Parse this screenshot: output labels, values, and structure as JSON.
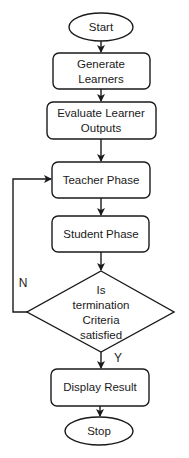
{
  "diagram": {
    "type": "flowchart",
    "colors": {
      "stroke": "#1a1a1a",
      "fill": "#ffffff",
      "text": "#1a1a1a"
    },
    "nodes": {
      "start": {
        "shape": "ellipse",
        "lines": [
          "Start"
        ]
      },
      "generate": {
        "shape": "rounded-rect",
        "lines": [
          "Generate",
          "Learners"
        ]
      },
      "evaluate": {
        "shape": "rounded-rect",
        "lines": [
          "Evaluate Learner",
          "Outputs"
        ]
      },
      "teacher": {
        "shape": "rounded-rect",
        "lines": [
          "Teacher Phase"
        ]
      },
      "student": {
        "shape": "rounded-rect",
        "lines": [
          "Student Phase"
        ]
      },
      "decision": {
        "shape": "diamond",
        "lines": [
          "Is",
          "termination",
          "Criteria",
          "satisfied"
        ]
      },
      "display": {
        "shape": "rounded-rect",
        "lines": [
          "Display Result"
        ]
      },
      "stop": {
        "shape": "ellipse",
        "lines": [
          "Stop"
        ]
      }
    },
    "edges": [
      {
        "from": "start",
        "to": "generate"
      },
      {
        "from": "generate",
        "to": "evaluate"
      },
      {
        "from": "evaluate",
        "to": "teacher"
      },
      {
        "from": "teacher",
        "to": "student"
      },
      {
        "from": "student",
        "to": "decision"
      },
      {
        "from": "decision",
        "to": "teacher",
        "label": "N"
      },
      {
        "from": "decision",
        "to": "display",
        "label": "Y"
      },
      {
        "from": "display",
        "to": "stop"
      }
    ],
    "edge_labels": {
      "no": "N",
      "yes": "Y"
    }
  }
}
